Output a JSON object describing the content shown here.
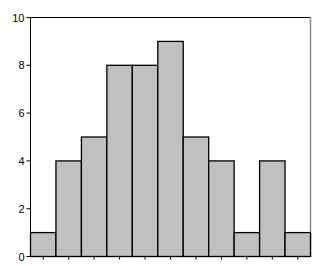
{
  "chart_data": {
    "type": "bar",
    "subtype": "histogram",
    "title": "",
    "xlabel": "",
    "ylabel": "",
    "categories": [
      "1",
      "2",
      "3",
      "4",
      "5",
      "6",
      "7",
      "8",
      "9",
      "10",
      "11"
    ],
    "values": [
      1,
      4,
      5,
      8,
      8,
      9,
      5,
      4,
      1,
      4,
      1
    ],
    "ylim": [
      0,
      10
    ],
    "yticks": [
      0,
      2,
      4,
      6,
      8,
      10
    ],
    "xtick_labels_visible": false,
    "grid": false,
    "legend": null,
    "colors": {
      "bar_fill": "#c0c0c0",
      "bar_edge": "#000000",
      "axis": "#000000",
      "frame_right": "#888888",
      "background": "#ffffff"
    }
  }
}
